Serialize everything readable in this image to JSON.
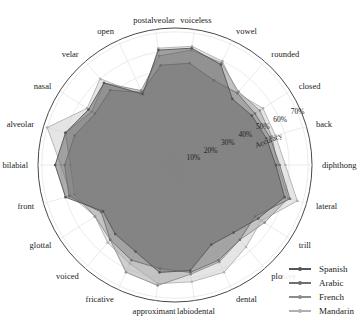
{
  "chart_data": {
    "type": "radar",
    "title": "",
    "radial_axis_label": "Accuracy",
    "radial_ticks": [
      "10%",
      "20%",
      "30%",
      "40%",
      "50%",
      "60%",
      "70%"
    ],
    "rlim": [
      0,
      72
    ],
    "grid": true,
    "legend_position": "lower right",
    "categories": [
      "voiceless",
      "vowel",
      "rounded",
      "closed",
      "back",
      "diphthong",
      "lateral",
      "trill",
      "plosive",
      "dental",
      "labiodental",
      "approximant",
      "fricative",
      "voiced",
      "glottal",
      "front",
      "bilabial",
      "alveolar",
      "nasal",
      "velar",
      "open",
      "postalveolar"
    ],
    "series": [
      {
        "name": "Spanish",
        "color": "#555555",
        "fill": "#6a6a6a",
        "values": [
          62,
          58,
          46,
          48,
          50,
          53,
          60,
          52,
          47,
          46,
          56,
          57,
          50,
          48,
          45,
          60,
          63,
          60,
          54,
          57,
          41,
          61
        ]
      },
      {
        "name": "Arabic",
        "color": "#6e6e6e",
        "fill": "#8a8a8a",
        "values": [
          54,
          49,
          50,
          50,
          52,
          55,
          63,
          50,
          52,
          55,
          57,
          55,
          55,
          52,
          46,
          58,
          58,
          55,
          50,
          52,
          42,
          53
        ]
      },
      {
        "name": "French",
        "color": "#8c8c8c",
        "fill": "#a8a8a8",
        "values": [
          61,
          59,
          51,
          53,
          53,
          54,
          62,
          56,
          52,
          56,
          58,
          64,
          62,
          52,
          50,
          55,
          55,
          60,
          52,
          57,
          43,
          58
        ]
      },
      {
        "name": "Mandarin",
        "color": "#b0b0b0",
        "fill": "#cfcfcf",
        "values": [
          63,
          60,
          50,
          55,
          55,
          58,
          67,
          54,
          57,
          62,
          62,
          63,
          57,
          54,
          50,
          57,
          60,
          70,
          55,
          60,
          40,
          62
        ]
      }
    ]
  },
  "legend": {
    "items": [
      {
        "label": "Spanish",
        "color": "#555555"
      },
      {
        "label": "Arabic",
        "color": "#6e6e6e"
      },
      {
        "label": "French",
        "color": "#8c8c8c"
      },
      {
        "label": "Mandarin",
        "color": "#b0b0b0"
      }
    ]
  }
}
